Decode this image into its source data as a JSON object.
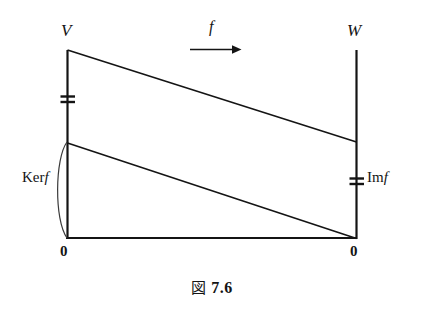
{
  "figure": {
    "caption_kanji": "図",
    "caption_number": "7.6",
    "caption_full": "図 7.6",
    "background_color": "#ffffff",
    "line_color": "#141414"
  },
  "labels": {
    "domain_space": "V",
    "codomain_space": "W",
    "map_name": "f",
    "kernel_prefix": "Ker",
    "kernel_fn": "f",
    "kernel_full": "Ker f",
    "image_prefix": "Im",
    "image_fn": "f",
    "image_full": "Im f",
    "zero_left": "0",
    "zero_right": "0"
  },
  "geometry": {
    "left_axis_x": 67,
    "right_axis_x": 356,
    "axis_top_y": 50,
    "axis_bottom_y": 238,
    "top_diagonal": {
      "x1": 67,
      "y1": 50,
      "x2": 356,
      "y2": 142
    },
    "lower_diagonal": {
      "x1": 67,
      "y1": 143,
      "x2": 356,
      "y2": 238
    },
    "baseline": {
      "x1": 67,
      "y1": 238,
      "x2": 356,
      "y2": 238
    },
    "arrow": {
      "x1": 190,
      "y1": 49,
      "x2": 241,
      "y2": 49
    },
    "left_tick_y": 99,
    "right_tick_y": 181,
    "kernel_brace": {
      "top_y": 142,
      "bottom_y": 238,
      "bulge_x": 55
    }
  }
}
